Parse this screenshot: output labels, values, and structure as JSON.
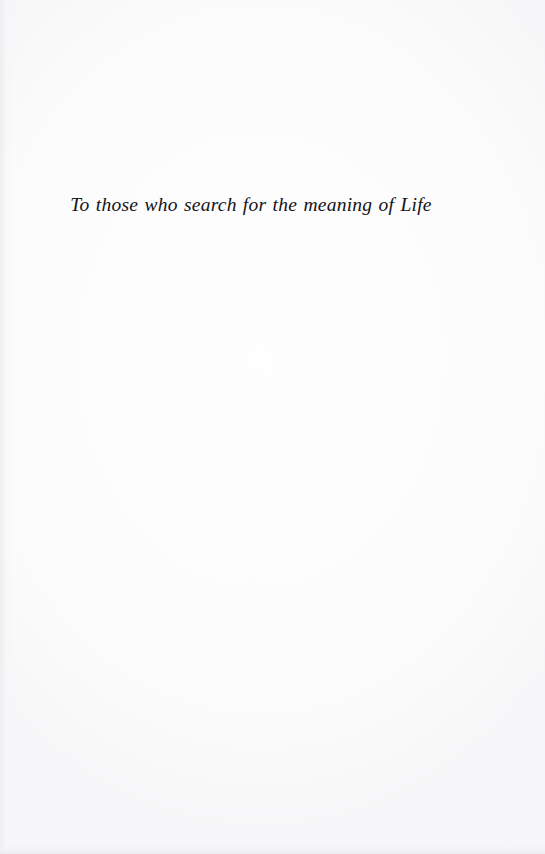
{
  "page": {
    "kind": "book-dedication-page",
    "background_color": "#fefefe",
    "ink_color": "#141418",
    "width_px": 545,
    "height_px": 854
  },
  "dedication": {
    "text": "To those who search for the meaning of Life"
  }
}
